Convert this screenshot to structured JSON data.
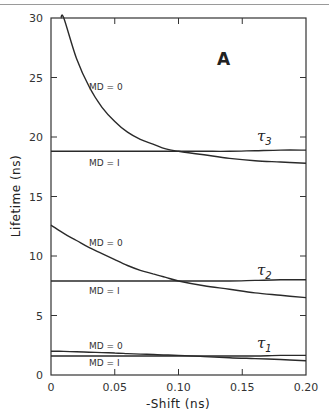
{
  "chart_data": {
    "type": "line",
    "panel_label": "A",
    "title": "",
    "xlabel": "-Shift (ns)",
    "ylabel": "Lifetime (ns)",
    "xlim": [
      0,
      0.2
    ],
    "ylim": [
      0,
      30
    ],
    "x_ticks": [
      0,
      0.05,
      0.1,
      0.15,
      0.2
    ],
    "x_tick_labels": [
      "0",
      "0.05",
      "0.10",
      "0.15",
      "0.20"
    ],
    "y_ticks": [
      0,
      5,
      10,
      15,
      20,
      25,
      30
    ],
    "y_tick_labels": [
      "0",
      "5",
      "10",
      "15",
      "20",
      "25",
      "30"
    ],
    "grid": false,
    "legend": "none (inline labels)",
    "x": [
      0,
      0.01,
      0.02,
      0.03,
      0.04,
      0.05,
      0.06,
      0.07,
      0.08,
      0.09,
      0.1,
      0.12,
      0.14,
      0.16,
      0.18,
      0.2
    ],
    "series": [
      {
        "name": "tau3 MD=0",
        "group": "τ3",
        "label": "MD = 0",
        "values": [
          null,
          30.0,
          26.6,
          24.2,
          22.5,
          21.3,
          20.4,
          19.8,
          19.4,
          19.0,
          18.8,
          18.5,
          18.2,
          18.0,
          17.9,
          17.8
        ]
      },
      {
        "name": "tau3 MD=1",
        "group": "τ3",
        "label": "MD = 1",
        "values": [
          18.8,
          18.8,
          18.8,
          18.8,
          18.8,
          18.8,
          18.8,
          18.8,
          18.8,
          18.8,
          18.8,
          18.8,
          18.8,
          18.85,
          18.9,
          18.9
        ]
      },
      {
        "name": "tau2 MD=0",
        "group": "τ2",
        "label": "MD = 0",
        "values": [
          12.6,
          11.9,
          11.3,
          10.7,
          10.2,
          9.7,
          9.2,
          8.8,
          8.5,
          8.2,
          7.9,
          7.5,
          7.2,
          6.9,
          6.7,
          6.5
        ]
      },
      {
        "name": "tau2 MD=1",
        "group": "τ2",
        "label": "MD = 1",
        "values": [
          7.9,
          7.9,
          7.9,
          7.9,
          7.9,
          7.9,
          7.9,
          7.9,
          7.9,
          7.9,
          7.9,
          7.9,
          7.9,
          7.95,
          8.0,
          8.0
        ]
      },
      {
        "name": "tau1 MD=0",
        "group": "τ1",
        "label": "MD = 0",
        "values": [
          2.0,
          1.98,
          1.95,
          1.92,
          1.88,
          1.85,
          1.8,
          1.76,
          1.72,
          1.68,
          1.65,
          1.55,
          1.45,
          1.38,
          1.3,
          1.2
        ]
      },
      {
        "name": "tau1 MD=1",
        "group": "τ1",
        "label": "MD = 1",
        "values": [
          1.6,
          1.6,
          1.6,
          1.6,
          1.6,
          1.6,
          1.6,
          1.6,
          1.6,
          1.6,
          1.6,
          1.6,
          1.6,
          1.6,
          1.65,
          1.65
        ]
      }
    ],
    "annotations": [
      {
        "text": "A",
        "x": 0.135,
        "y": 26.8
      },
      {
        "text": "τ3",
        "x": 0.17,
        "y": 19.6
      },
      {
        "text": "τ2",
        "x": 0.17,
        "y": 8.7
      },
      {
        "text": "τ1",
        "x": 0.17,
        "y": 2.4
      },
      {
        "text": "MD = 0",
        "x": 0.04,
        "y": 24.4
      },
      {
        "text": "MD = 1",
        "x": 0.04,
        "y": 17.7
      },
      {
        "text": "MD = 0",
        "x": 0.04,
        "y": 11.2
      },
      {
        "text": "MD = 1",
        "x": 0.04,
        "y": 6.8
      },
      {
        "text": "MD = 0",
        "x": 0.04,
        "y": 2.6
      },
      {
        "text": "MD = 1",
        "x": 0.04,
        "y": 0.7
      }
    ]
  },
  "labels": {
    "panel": "A",
    "xlabel": "-Shift (ns)",
    "ylabel": "Lifetime (ns)",
    "tau": "τ",
    "tau3_sub": "3",
    "tau2_sub": "2",
    "tau1_sub": "1",
    "md0": "MD = 0",
    "md1": "MD = I",
    "xticks": [
      "0",
      "0.05",
      "0.10",
      "0.15",
      "0.20"
    ],
    "yticks": [
      "0",
      "5",
      "10",
      "15",
      "20",
      "25",
      "30"
    ]
  }
}
